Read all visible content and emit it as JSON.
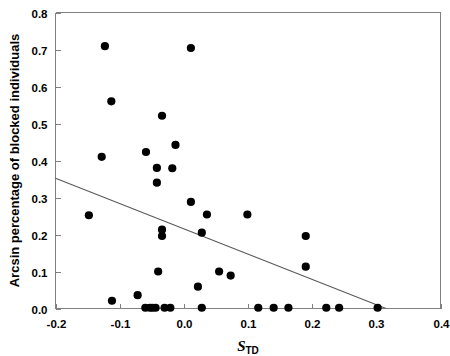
{
  "chart_data": {
    "type": "scatter",
    "title": "",
    "subtitle": "",
    "xlabel": "S_TD",
    "xlabel_main": "S",
    "xlabel_sub": "TD",
    "ylabel": "Arcsin percentage of blocked individuals",
    "xlim": [
      -0.2,
      0.4
    ],
    "ylim": [
      0.0,
      0.8
    ],
    "xticks": [
      -0.2,
      -0.1,
      0.0,
      0.1,
      0.2,
      0.3,
      0.4
    ],
    "xticklabels": [
      "-0.2",
      "-0.1",
      "0.0",
      "0.1",
      "0.2",
      "0.3",
      "0.4"
    ],
    "yticks": [
      0.0,
      0.1,
      0.2,
      0.3,
      0.4,
      0.5,
      0.6,
      0.7,
      0.8
    ],
    "yticklabels": [
      "0.0",
      "0.1",
      "0.2",
      "0.3",
      "0.4",
      "0.5",
      "0.6",
      "0.7",
      "0.8"
    ],
    "grid": false,
    "legend": false,
    "marker": "filled-circle",
    "marker_color": "#000000",
    "marker_size": 4.1,
    "points": [
      {
        "x": -0.123,
        "y": 0.709
      },
      {
        "x": 0.011,
        "y": 0.704
      },
      {
        "x": -0.113,
        "y": 0.56
      },
      {
        "x": -0.034,
        "y": 0.521
      },
      {
        "x": -0.013,
        "y": 0.442
      },
      {
        "x": -0.059,
        "y": 0.423
      },
      {
        "x": -0.128,
        "y": 0.41
      },
      {
        "x": -0.042,
        "y": 0.38
      },
      {
        "x": -0.018,
        "y": 0.379
      },
      {
        "x": -0.042,
        "y": 0.34
      },
      {
        "x": -0.148,
        "y": 0.252
      },
      {
        "x": 0.011,
        "y": 0.288
      },
      {
        "x": 0.036,
        "y": 0.254
      },
      {
        "x": 0.099,
        "y": 0.254
      },
      {
        "x": -0.034,
        "y": 0.213
      },
      {
        "x": -0.034,
        "y": 0.196
      },
      {
        "x": 0.028,
        "y": 0.205
      },
      {
        "x": 0.19,
        "y": 0.196
      },
      {
        "x": 0.19,
        "y": 0.113
      },
      {
        "x": -0.04,
        "y": 0.1
      },
      {
        "x": 0.055,
        "y": 0.1
      },
      {
        "x": 0.073,
        "y": 0.089
      },
      {
        "x": 0.022,
        "y": 0.059
      },
      {
        "x": -0.072,
        "y": 0.036
      },
      {
        "x": -0.112,
        "y": 0.021
      },
      {
        "x": -0.06,
        "y": 0.002
      },
      {
        "x": -0.053,
        "y": 0.002
      },
      {
        "x": -0.049,
        "y": 0.002
      },
      {
        "x": -0.044,
        "y": 0.002
      },
      {
        "x": -0.03,
        "y": 0.002
      },
      {
        "x": -0.021,
        "y": 0.002
      },
      {
        "x": 0.028,
        "y": 0.002
      },
      {
        "x": 0.116,
        "y": 0.002
      },
      {
        "x": 0.14,
        "y": 0.002
      },
      {
        "x": 0.163,
        "y": 0.002
      },
      {
        "x": 0.222,
        "y": 0.002
      },
      {
        "x": 0.242,
        "y": 0.002
      },
      {
        "x": 0.302,
        "y": 0.002
      }
    ],
    "trendline": {
      "type": "linear-fit",
      "x_start": -0.2,
      "y_start": 0.352,
      "x_end": 0.315,
      "y_end": 0.0,
      "color": "#595959"
    }
  }
}
